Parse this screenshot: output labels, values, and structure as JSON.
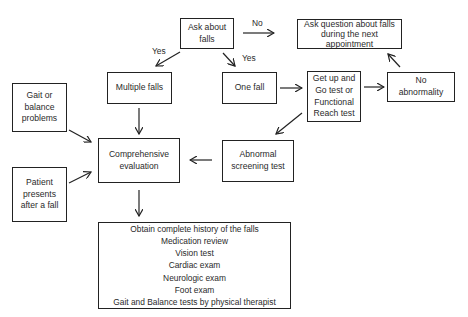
{
  "diagram": {
    "type": "flowchart",
    "nodes": {
      "ask": "Ask about\nfalls",
      "ask_next": "Ask question about falls\nduring the next\nappointment",
      "multiple": "Multiple falls",
      "one": "One fall",
      "getup": "Get up and\nGo test or\nFunctional\nReach test",
      "noabn": "No\nabnormality",
      "gait": "Gait or\nbalance\nproblems",
      "comprehensive": "Comprehensive\nevaluation",
      "abnormal": "Abnormal\nscreening test",
      "patient": "Patient\npresents\nafter a fall",
      "evaluation_items": [
        "Obtain complete history of the falls",
        "Medication review",
        "Vision test",
        "Cardiac exam",
        "Neurologic exam",
        "Foot exam",
        "Gait and Balance tests by physical therapist"
      ]
    },
    "edge_labels": {
      "no": "No",
      "yes_left": "Yes",
      "yes_right": "Yes"
    },
    "edges": [
      {
        "from": "ask",
        "to": "ask_next",
        "label": "No"
      },
      {
        "from": "ask",
        "to": "multiple",
        "label": "Yes"
      },
      {
        "from": "ask",
        "to": "one",
        "label": "Yes"
      },
      {
        "from": "one",
        "to": "getup"
      },
      {
        "from": "getup",
        "to": "noabn"
      },
      {
        "from": "noabn",
        "to": "ask_next"
      },
      {
        "from": "getup",
        "to": "abnormal"
      },
      {
        "from": "abnormal",
        "to": "comprehensive"
      },
      {
        "from": "multiple",
        "to": "comprehensive"
      },
      {
        "from": "gait",
        "to": "comprehensive"
      },
      {
        "from": "patient",
        "to": "comprehensive"
      },
      {
        "from": "comprehensive",
        "to": "evaluation_items"
      }
    ]
  }
}
